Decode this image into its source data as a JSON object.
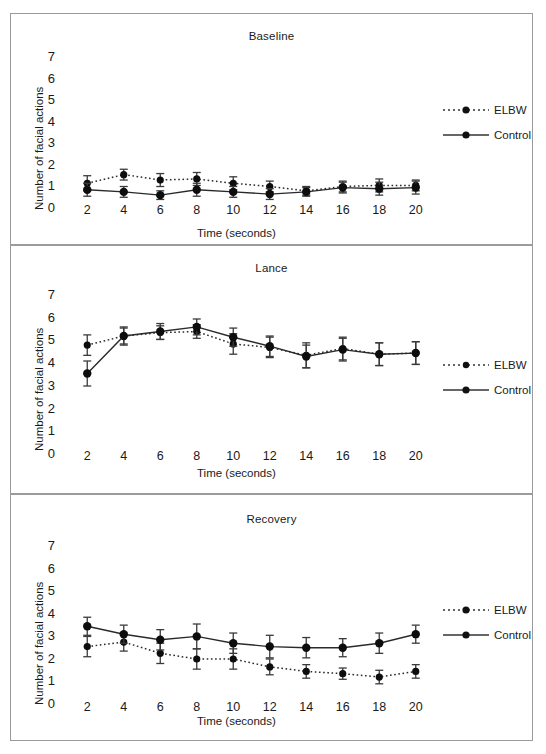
{
  "figure": {
    "background": "#ffffff",
    "frame_color": "#9b9b9b",
    "series_colors": {
      "elbw": "#222222",
      "control": "#222222"
    }
  },
  "axis": {
    "ylabel": "Number of facial actions",
    "xlabel": "Time (seconds)",
    "yticks": [
      "0",
      "1",
      "2",
      "3",
      "4",
      "5",
      "6",
      "7"
    ],
    "xticks": [
      "2",
      "4",
      "6",
      "8",
      "10",
      "12",
      "14",
      "16",
      "18",
      "20"
    ]
  },
  "legend": {
    "items": [
      {
        "label": "ELBW",
        "style": "dotted",
        "marker": "circle"
      },
      {
        "label": "Control",
        "style": "solid",
        "marker": "circle"
      }
    ]
  },
  "chart_data": [
    {
      "type": "line",
      "title": "Baseline",
      "xlabel": "Time (seconds)",
      "ylabel": "Number of facial actions",
      "x": [
        2,
        4,
        6,
        8,
        10,
        12,
        14,
        16,
        18,
        20
      ],
      "xlim": [
        1,
        21
      ],
      "ylim": [
        0,
        7
      ],
      "grid": false,
      "legend_position": "right",
      "series": [
        {
          "name": "ELBW",
          "values": [
            1.1,
            1.5,
            1.25,
            1.3,
            1.1,
            0.95,
            0.75,
            0.95,
            1.0,
            1.0
          ],
          "errors": [
            0.35,
            0.25,
            0.3,
            0.3,
            0.3,
            0.25,
            0.2,
            0.25,
            0.3,
            0.25
          ]
        },
        {
          "name": "Control",
          "values": [
            0.8,
            0.7,
            0.55,
            0.8,
            0.7,
            0.6,
            0.7,
            0.9,
            0.85,
            0.9
          ],
          "errors": [
            0.3,
            0.25,
            0.2,
            0.3,
            0.25,
            0.25,
            0.2,
            0.25,
            0.3,
            0.3
          ]
        }
      ]
    },
    {
      "type": "line",
      "title": "Lance",
      "xlabel": "Time (seconds)",
      "ylabel": "Number of facial actions",
      "x": [
        2,
        4,
        6,
        8,
        10,
        12,
        14,
        16,
        18,
        20
      ],
      "xlim": [
        1,
        21
      ],
      "ylim": [
        0,
        7
      ],
      "grid": false,
      "legend_position": "right",
      "series": [
        {
          "name": "ELBW",
          "values": [
            4.75,
            5.15,
            5.3,
            5.35,
            4.8,
            4.65,
            4.3,
            4.6,
            4.35,
            4.4
          ],
          "errors": [
            0.45,
            0.35,
            0.3,
            0.3,
            0.45,
            0.45,
            0.55,
            0.5,
            0.5,
            0.5
          ]
        },
        {
          "name": "Control",
          "values": [
            3.5,
            5.15,
            5.35,
            5.55,
            5.1,
            4.7,
            4.25,
            4.55,
            4.35,
            4.4
          ],
          "errors": [
            0.55,
            0.4,
            0.35,
            0.35,
            0.4,
            0.45,
            0.5,
            0.5,
            0.5,
            0.5
          ]
        }
      ]
    },
    {
      "type": "line",
      "title": "Recovery",
      "xlabel": "Time (seconds)",
      "ylabel": "Number of facial actions",
      "x": [
        2,
        4,
        6,
        8,
        10,
        12,
        14,
        16,
        18,
        20
      ],
      "xlim": [
        1,
        21
      ],
      "ylim": [
        0,
        7
      ],
      "grid": false,
      "legend_position": "right",
      "series": [
        {
          "name": "ELBW",
          "values": [
            2.5,
            2.7,
            2.2,
            1.95,
            1.95,
            1.6,
            1.4,
            1.3,
            1.15,
            1.4
          ],
          "errors": [
            0.45,
            0.4,
            0.45,
            0.45,
            0.45,
            0.35,
            0.3,
            0.25,
            0.3,
            0.3
          ]
        },
        {
          "name": "Control",
          "values": [
            3.4,
            3.05,
            2.8,
            2.95,
            2.65,
            2.5,
            2.45,
            2.45,
            2.65,
            3.05
          ],
          "errors": [
            0.4,
            0.4,
            0.45,
            0.55,
            0.45,
            0.5,
            0.45,
            0.4,
            0.45,
            0.4
          ]
        }
      ]
    }
  ]
}
